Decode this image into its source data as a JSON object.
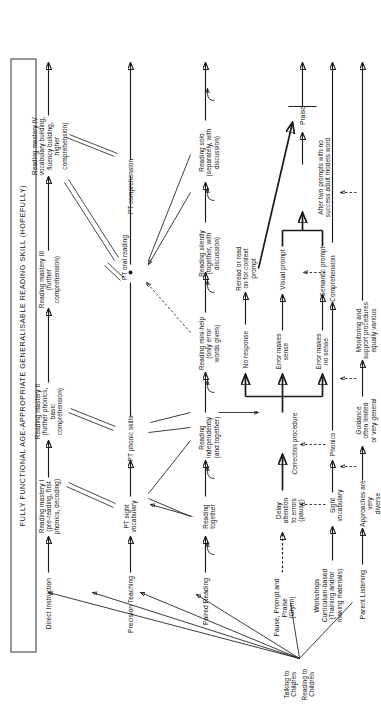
{
  "diagram": {
    "type": "flowchart",
    "orientation": "rotated-90-ccw",
    "goal_box": "FULLY FUNCTIONAL AGE-APPROPRIATE GENERALISABLE READING SKILL (HOPEFULLY)",
    "origin": {
      "line1": "Talking to Children",
      "arrow": "↓",
      "line2": "Reading to Children"
    },
    "columns": [
      {
        "id": "direct-instruction",
        "label": "Direct Instruction"
      },
      {
        "id": "precision-teaching",
        "label": "Precision Teaching"
      },
      {
        "id": "paired-reading",
        "label": "Paired Reading"
      },
      {
        "id": "pause-prompt-praise",
        "label": "Pause, Prompt and Praise\n(Glynn)"
      },
      {
        "id": "workshops",
        "label": "Workshops\nCurriculum-based\n(Training and/or\nmaking materials)"
      },
      {
        "id": "parent-listening",
        "label": "Parent Listening"
      }
    ],
    "nodes": [
      {
        "id": "rm1",
        "label": "Reading mastery I\n(pre-reading, first\nphonics, decoding)"
      },
      {
        "id": "rm2",
        "label": "Reading mastery II\n(further phonics,\nbasic\ncomprehension)"
      },
      {
        "id": "rm3",
        "label": "Reading mastery III\n(further\ncomprehension)"
      },
      {
        "id": "rm4",
        "label": "Reading mastery IV\nvocabulary building,\nfluency building,\nhigher\ncomprehension)"
      },
      {
        "id": "pt-sight",
        "label": "PT sight\nvocabulary"
      },
      {
        "id": "pt-phonic",
        "label": "PT phonic skills"
      },
      {
        "id": "pt-oral",
        "label": "PT oral reading"
      },
      {
        "id": "pt-comp",
        "label": "PT comprehension"
      },
      {
        "id": "pr-together",
        "label": "Reading\ntogether"
      },
      {
        "id": "pr-indep",
        "label": "Reading\nindependently\n(and together)"
      },
      {
        "id": "pr-mini",
        "label": "Reading mini-help\n(only error\nwords given)"
      },
      {
        "id": "pr-silent",
        "label": "Reading silently\n(together, with\ndiscussion)"
      },
      {
        "id": "pr-solo",
        "label": "Reading solo\n(separately, with\ndiscussion)"
      },
      {
        "id": "ppp-delay",
        "label": "Delay attention\nto errors\n(pause)"
      },
      {
        "id": "ppp-correction",
        "label": "Correction procedure"
      },
      {
        "id": "ppp-noresp",
        "label": "No response"
      },
      {
        "id": "ppp-reread",
        "label": "Reread or read\non for context\nprompt"
      },
      {
        "id": "ppp-sense",
        "label": "Error makes\nsense"
      },
      {
        "id": "ppp-nosense",
        "label": "Error makes\nno sense"
      },
      {
        "id": "ppp-visual",
        "label": "Visual prompt"
      },
      {
        "id": "ppp-semantic",
        "label": "Semantic prompt"
      },
      {
        "id": "ppp-model",
        "label": "After two prompts with no\nsuccess adult models word"
      },
      {
        "id": "ppp-praise",
        "label": "Praise"
      },
      {
        "id": "ws-sight",
        "label": "Sight\nvocabulary"
      },
      {
        "id": "ws-phonics",
        "label": "Phonics"
      },
      {
        "id": "ws-comp",
        "label": "Comprehension"
      },
      {
        "id": "pl-diverse",
        "label": "Approaches are very\ndiverse"
      },
      {
        "id": "pl-guidance",
        "label": "Guidance\noften limited\nor very general"
      },
      {
        "id": "pl-monitor",
        "label": "Monitoring and\nsupport procedures\nequally various"
      }
    ],
    "style": {
      "ink": "#1a1a1a",
      "paper": "#ffffff",
      "box_border": "#333333"
    }
  }
}
